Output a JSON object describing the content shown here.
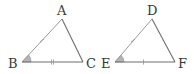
{
  "diagram": {
    "type": "congruent-triangles",
    "colors": {
      "edge": "#6e6e6e",
      "tick": "#9a9a9a",
      "angle_fill": "#b5b5b5",
      "label": "#3a3a3a"
    },
    "triangles": [
      {
        "name": "ABC",
        "vertices": [
          {
            "label": "A",
            "x": 62,
            "y": 19,
            "label_x": 57,
            "label_y": 15
          },
          {
            "label": "B",
            "x": 22,
            "y": 62,
            "label_x": 8,
            "label_y": 68
          },
          {
            "label": "C",
            "x": 83,
            "y": 62,
            "label_x": 86,
            "label_y": 68
          }
        ],
        "marks": {
          "AB": "single-tick",
          "BC": "double-tick",
          "angle_B": "filled-wedge"
        }
      },
      {
        "name": "DEF",
        "vertices": [
          {
            "label": "D",
            "x": 152,
            "y": 19,
            "label_x": 147,
            "label_y": 15
          },
          {
            "label": "E",
            "x": 115,
            "y": 62,
            "label_x": 101,
            "label_y": 68
          },
          {
            "label": "F",
            "x": 175,
            "y": 62,
            "label_x": 178,
            "label_y": 68
          }
        ],
        "marks": {
          "DE": "single-tick",
          "EF": "single-tick",
          "angle_E": "filled-wedge"
        }
      }
    ]
  }
}
